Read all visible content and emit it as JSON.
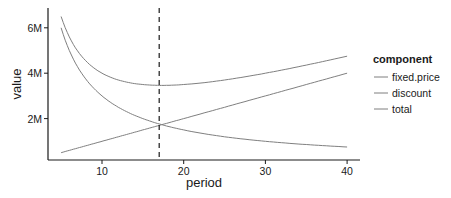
{
  "chart_data": {
    "type": "line",
    "title": "",
    "xlabel": "period",
    "ylabel": "value",
    "x_ticks": [
      10,
      20,
      30,
      40
    ],
    "x_tick_labels": [
      "10",
      "20",
      "30",
      "40"
    ],
    "y_ticks": [
      2000000,
      4000000,
      6000000
    ],
    "y_tick_labels": [
      "2M",
      "4M",
      "6M"
    ],
    "xlim": [
      3.3,
      41.7
    ],
    "ylim": [
      180000,
      6800000
    ],
    "grid": false,
    "legend": {
      "title": "component",
      "position": "right",
      "entries": [
        "fixed.price",
        "discount",
        "total"
      ]
    },
    "vline": {
      "x": 17,
      "style": "dashed"
    },
    "x": [
      5,
      7.5,
      10,
      12.5,
      15,
      17,
      20,
      25,
      30,
      35,
      40
    ],
    "series": [
      {
        "name": "fixed.price",
        "values": [
          6000000,
          4000000,
          3000000,
          2400000,
          2000000,
          1765000,
          1500000,
          1200000,
          1000000,
          857000,
          750000
        ]
      },
      {
        "name": "discount",
        "values": [
          500000,
          750000,
          1000000,
          1250000,
          1500000,
          1700000,
          2000000,
          2500000,
          3000000,
          3500000,
          4000000
        ]
      },
      {
        "name": "total",
        "values": [
          6500000,
          4750000,
          4000000,
          3650000,
          3500000,
          3465000,
          3500000,
          3700000,
          4000000,
          4357000,
          4750000
        ]
      }
    ]
  },
  "colors": {
    "line": "#7f7f7f",
    "axis": "#1a1a1a",
    "text": "#1a1a1a"
  }
}
